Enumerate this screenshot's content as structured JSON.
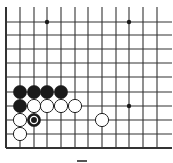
{
  "diagram": {
    "type": "go-board-fragment",
    "colors": {
      "background": "#ffffff",
      "line": "#333333",
      "black_stone": "#1a1a1a",
      "white_stone": "#ffffff",
      "stone_outline": "#222222",
      "star_point": "#1a1a1a"
    },
    "grid": {
      "x_lines": [
        6,
        20,
        34,
        47,
        61,
        75,
        88,
        102,
        116,
        129,
        143,
        157
      ],
      "y_lines": [
        22,
        35,
        49,
        63,
        77,
        92,
        106,
        120,
        134,
        148
      ],
      "x_extent": [
        6,
        172
      ],
      "y_extent": [
        7,
        148
      ],
      "edges": [
        "left",
        "bottom"
      ]
    },
    "star_points": [
      {
        "col": 3,
        "row": 0
      },
      {
        "col": 9,
        "row": 0
      },
      {
        "col": 9,
        "row": 6
      }
    ],
    "stones": [
      {
        "color": "black",
        "col": 1,
        "row": 5
      },
      {
        "color": "black",
        "col": 2,
        "row": 5
      },
      {
        "color": "black",
        "col": 3,
        "row": 5
      },
      {
        "color": "black",
        "col": 4,
        "row": 5
      },
      {
        "color": "black",
        "col": 1,
        "row": 6
      },
      {
        "color": "white",
        "col": 2,
        "row": 6
      },
      {
        "color": "white",
        "col": 3,
        "row": 6
      },
      {
        "color": "white",
        "col": 4,
        "row": 6
      },
      {
        "color": "white",
        "col": 5,
        "row": 6
      },
      {
        "color": "white",
        "col": 1,
        "row": 7
      },
      {
        "color": "black",
        "col": 2,
        "row": 7,
        "marked": true
      },
      {
        "color": "white",
        "col": 7,
        "row": 7
      },
      {
        "color": "white",
        "col": 1,
        "row": 8
      }
    ],
    "caption": "—"
  }
}
